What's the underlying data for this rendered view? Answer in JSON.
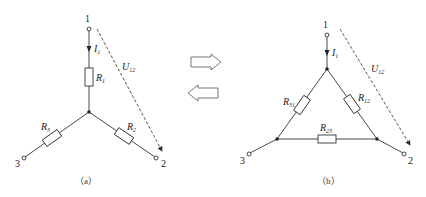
{
  "diagram_a": {
    "caption": "（a）",
    "nodes": [
      "1",
      "2",
      "3"
    ],
    "current": {
      "sym": "I",
      "sub": "1"
    },
    "voltage": {
      "sym": "U",
      "sub": "12"
    },
    "resistors": [
      {
        "sym": "R",
        "sub": "1"
      },
      {
        "sym": "R",
        "sub": "2"
      },
      {
        "sym": "R",
        "sub": "3"
      }
    ]
  },
  "diagram_b": {
    "caption": "（b）",
    "nodes": [
      "1",
      "2",
      "3"
    ],
    "current": {
      "sym": "I",
      "sub": "1"
    },
    "voltage": {
      "sym": "U",
      "sub": "12"
    },
    "resistors": [
      {
        "sym": "R",
        "sub": "12"
      },
      {
        "sym": "R",
        "sub": "23"
      },
      {
        "sym": "R",
        "sub": "31"
      }
    ]
  },
  "transform_arrows": [
    "right-arrow",
    "left-arrow"
  ]
}
